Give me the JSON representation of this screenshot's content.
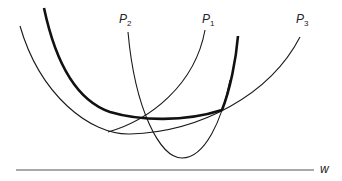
{
  "diagram": {
    "curves": [
      {
        "name": "P1",
        "label": "P",
        "subscript": "1",
        "weight": "thin"
      },
      {
        "name": "P2",
        "label": "P",
        "subscript": "2",
        "weight": "thin"
      },
      {
        "name": "P3",
        "label": "P",
        "subscript": "3",
        "weight": "thin"
      },
      {
        "name": "envelope",
        "label": "",
        "weight": "thick"
      }
    ],
    "axis": {
      "label": "w"
    },
    "colors": {
      "line": "#1a1a1a",
      "axis": "#555555"
    }
  }
}
